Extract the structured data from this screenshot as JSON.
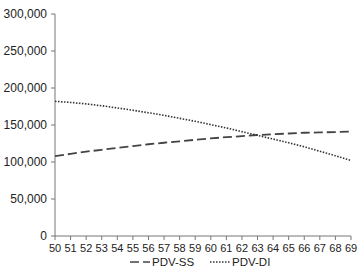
{
  "chart_data": {
    "type": "line",
    "title": "",
    "xlabel": "",
    "ylabel": "",
    "x": [
      50,
      51,
      52,
      53,
      54,
      55,
      56,
      57,
      58,
      59,
      60,
      61,
      62,
      63,
      64,
      65,
      66,
      67,
      68,
      69
    ],
    "xlim": [
      50,
      69
    ],
    "ylim": [
      0,
      300000
    ],
    "yticks": [
      0,
      50000,
      100000,
      150000,
      200000,
      250000,
      300000
    ],
    "ytick_labels": [
      "0",
      "50,000",
      "100,000",
      "150,000",
      "200,000",
      "250,000",
      "300,000"
    ],
    "xtick_labels": [
      "50",
      "51",
      "52",
      "53",
      "54",
      "55",
      "56",
      "57",
      "58",
      "59",
      "60",
      "61",
      "62",
      "63",
      "64",
      "65",
      "66",
      "67",
      "68",
      "69"
    ],
    "grid": false,
    "legend_position": "bottom",
    "series": [
      {
        "name": "PDV-SS",
        "style": "dashed",
        "color": "#444444",
        "values": [
          108000,
          111000,
          114000,
          116500,
          119000,
          121500,
          124000,
          126000,
          128000,
          130000,
          132000,
          133500,
          135000,
          136500,
          137500,
          138500,
          139500,
          140000,
          140500,
          141000
        ]
      },
      {
        "name": "PDV-DI",
        "style": "dotted",
        "color": "#333333",
        "values": [
          182000,
          180500,
          178500,
          176000,
          173000,
          170000,
          166500,
          163000,
          159000,
          155000,
          150500,
          146000,
          141000,
          136000,
          131000,
          126000,
          120500,
          114500,
          108500,
          102000
        ]
      }
    ]
  },
  "legend": {
    "items": [
      {
        "label": "PDV-SS"
      },
      {
        "label": "PDV-DI"
      }
    ]
  }
}
